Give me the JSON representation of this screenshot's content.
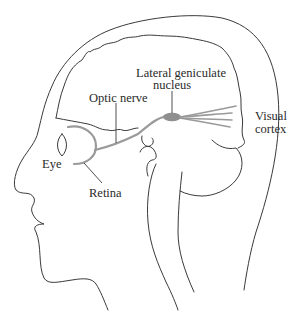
{
  "figure": {
    "labels": {
      "lgn_line1": "Lateral geniculate",
      "lgn_line2": "nucleus",
      "optic_nerve": "Optic nerve",
      "visual_cortex_line1": "Visual",
      "visual_cortex_line2": "cortex",
      "eye": "Eye",
      "retina": "Retina"
    },
    "colors": {
      "outline": "#3a3a3a",
      "pathway": "#9a9a9a",
      "lgn": "#8f8f8f",
      "background": "#ffffff"
    }
  }
}
